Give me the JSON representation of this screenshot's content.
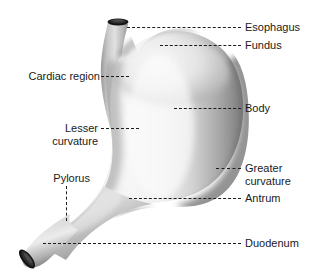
{
  "figure": {
    "background_color": "#ffffff",
    "ink_color": "#1a1a1a",
    "organ_light": "#f2f2f2",
    "organ_mid": "#c9c9c9",
    "organ_shadow": "#8a8a8a",
    "organ_dark": "#5e5e5e",
    "lumen_color": "#1b1b1b"
  },
  "labels": {
    "esophagus": "Esophagus",
    "fundus": "Fundus",
    "cardiac_region": "Cardiac region",
    "body": "Body",
    "lesser_curvature_line1": "Lesser",
    "lesser_curvature_line2": "curvature",
    "greater_curvature_line1": "Greater",
    "greater_curvature_line2": "curvature",
    "pylorus": "Pylorus",
    "antrum": "Antrum",
    "duodenum": "Duodenum"
  },
  "parts": [
    {
      "id": "esophagus",
      "label": "Esophagus",
      "side": "right"
    },
    {
      "id": "fundus",
      "label": "Fundus",
      "side": "right"
    },
    {
      "id": "cardiac-region",
      "label": "Cardiac region",
      "side": "left"
    },
    {
      "id": "body",
      "label": "Body",
      "side": "right"
    },
    {
      "id": "lesser-curvature",
      "label": "Lesser curvature",
      "side": "left"
    },
    {
      "id": "greater-curvature",
      "label": "Greater curvature",
      "side": "right"
    },
    {
      "id": "pylorus",
      "label": "Pylorus",
      "side": "left"
    },
    {
      "id": "antrum",
      "label": "Antrum",
      "side": "right"
    },
    {
      "id": "duodenum",
      "label": "Duodenum",
      "side": "right"
    }
  ]
}
